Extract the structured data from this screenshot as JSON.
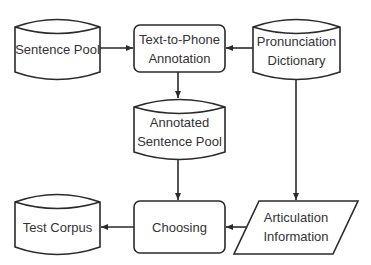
{
  "diagram": {
    "type": "flowchart",
    "colors": {
      "stroke": "#2a2a2a",
      "text": "#333333",
      "background": "#ffffff"
    },
    "nodes": [
      {
        "id": "sentence_pool",
        "shape": "cylinder",
        "label": "Sentence Pool"
      },
      {
        "id": "t2p",
        "shape": "rounded-rect",
        "label_line1": "Text-to-Phone",
        "label_line2": "Annotation"
      },
      {
        "id": "pron_dict",
        "shape": "cylinder",
        "label_line1": "Pronunciation",
        "label_line2": "Dictionary"
      },
      {
        "id": "annotated_pool",
        "shape": "cylinder",
        "label_line1": "Annotated",
        "label_line2": "Sentence Pool"
      },
      {
        "id": "test_corpus",
        "shape": "cylinder",
        "label": "Test Corpus"
      },
      {
        "id": "choosing",
        "shape": "rounded-rect",
        "label": "Choosing"
      },
      {
        "id": "articulation",
        "shape": "parallelogram",
        "label_line1": "Articulation",
        "label_line2": "Information"
      }
    ],
    "edges": [
      {
        "from": "sentence_pool",
        "to": "t2p"
      },
      {
        "from": "pron_dict",
        "to": "t2p"
      },
      {
        "from": "t2p",
        "to": "annotated_pool"
      },
      {
        "from": "annotated_pool",
        "to": "choosing"
      },
      {
        "from": "pron_dict",
        "to": "articulation"
      },
      {
        "from": "articulation",
        "to": "choosing"
      },
      {
        "from": "choosing",
        "to": "test_corpus"
      }
    ]
  }
}
